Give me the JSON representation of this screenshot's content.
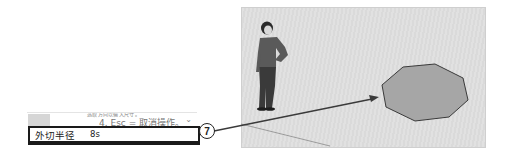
{
  "instruction_panel": {
    "line1_partial": "选取方向以输入尺寸。",
    "line2": "4. Esc = 取消操作。",
    "expand_icon": "chevron-down-icon",
    "expand_glyph": "⌄"
  },
  "measurements_box": {
    "label": "外切半径",
    "value": "8s"
  },
  "callout": {
    "number": "7"
  },
  "viewport": {
    "scene_objects": [
      "person-figure",
      "octagon-face"
    ],
    "colors": {
      "background": "#e0e0e0",
      "octagon_fill": "#a6a6a6",
      "octagon_edge": "#3a3a3a",
      "arrow": "#3a3a3a"
    }
  }
}
